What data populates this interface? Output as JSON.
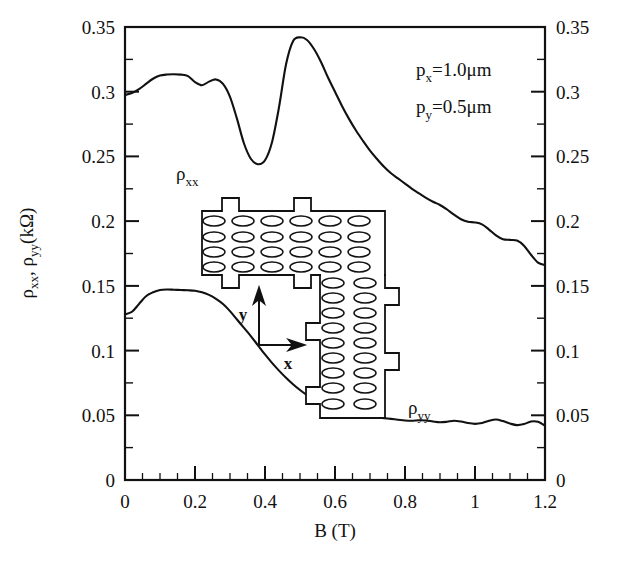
{
  "figure": {
    "background": "#ffffff",
    "ink_color": "#111111"
  },
  "chart_data": {
    "type": "line",
    "title": "",
    "xlabel": "B (T)",
    "ylabel": "ρxx, ρyy(kΩ)",
    "ylabel_parts": {
      "rho1": "ρ",
      "sub1": "xx",
      "comma": ", ",
      "rho2": "ρ",
      "sub2": "yy",
      "unit": "(kΩ)"
    },
    "xlim": [
      0,
      1.2
    ],
    "ylim": [
      0,
      0.35
    ],
    "grid": false,
    "legend_position": "inline-labels",
    "x_major_ticks": [
      0,
      0.2,
      0.4,
      0.6,
      0.8,
      1,
      1.2
    ],
    "x_major_tick_labels": [
      "0",
      "0.2",
      "0.4",
      "0.6",
      "0.8",
      "1",
      "1.2"
    ],
    "x_minor_tick_step": 0.05,
    "y_major_ticks": [
      0,
      0.05,
      0.1,
      0.15,
      0.2,
      0.25,
      0.3,
      0.35
    ],
    "y_major_tick_labels": [
      "0",
      "0.05",
      "0.1",
      "0.15",
      "0.2",
      "0.25",
      "0.3",
      "0.35"
    ],
    "left_axis_labels": [
      "0.35",
      "0.3",
      "0.25",
      "0.2",
      "0.15",
      "0.1",
      "0.05",
      "0"
    ],
    "right_axis_labels": [
      "0.35",
      "0.3",
      "0.25",
      "0.2",
      "0.15",
      "0.1",
      "0.05",
      "0"
    ],
    "series": [
      {
        "name": "ρxx",
        "label": "ρ",
        "label_sub": "xx",
        "color": "#111111",
        "x": [
          0.0,
          0.02,
          0.04,
          0.06,
          0.08,
          0.1,
          0.12,
          0.14,
          0.16,
          0.18,
          0.2,
          0.22,
          0.24,
          0.26,
          0.28,
          0.3,
          0.32,
          0.34,
          0.36,
          0.38,
          0.4,
          0.42,
          0.44,
          0.46,
          0.48,
          0.5,
          0.52,
          0.54,
          0.56,
          0.58,
          0.6,
          0.62,
          0.64,
          0.66,
          0.68,
          0.7,
          0.72,
          0.74,
          0.76,
          0.78,
          0.8,
          0.82,
          0.84,
          0.86,
          0.88,
          0.9,
          0.92,
          0.94,
          0.96,
          0.98,
          1.0,
          1.02,
          1.04,
          1.06,
          1.08,
          1.1,
          1.12,
          1.14,
          1.16,
          1.18,
          1.2
        ],
        "y": [
          0.2975,
          0.299,
          0.302,
          0.306,
          0.31,
          0.3125,
          0.3133,
          0.3135,
          0.3132,
          0.312,
          0.3075,
          0.305,
          0.3078,
          0.3095,
          0.306,
          0.296,
          0.279,
          0.26,
          0.248,
          0.244,
          0.247,
          0.261,
          0.288,
          0.321,
          0.339,
          0.342,
          0.34,
          0.333,
          0.323,
          0.311,
          0.3,
          0.289,
          0.279,
          0.27,
          0.262,
          0.2545,
          0.248,
          0.242,
          0.237,
          0.233,
          0.229,
          0.225,
          0.2215,
          0.218,
          0.215,
          0.2125,
          0.209,
          0.205,
          0.2015,
          0.1995,
          0.199,
          0.1975,
          0.1935,
          0.189,
          0.186,
          0.1855,
          0.185,
          0.181,
          0.174,
          0.168,
          0.166
        ]
      },
      {
        "name": "ρyy",
        "label": "ρ",
        "label_sub": "yy",
        "color": "#111111",
        "x": [
          0.0,
          0.02,
          0.04,
          0.06,
          0.08,
          0.1,
          0.12,
          0.14,
          0.16,
          0.18,
          0.2,
          0.22,
          0.24,
          0.26,
          0.28,
          0.3,
          0.32,
          0.34,
          0.36,
          0.38,
          0.4,
          0.42,
          0.44,
          0.46,
          0.48,
          0.5,
          0.52,
          0.54,
          0.56,
          0.58,
          0.6,
          0.62,
          0.64,
          0.66,
          0.68,
          0.7,
          0.72,
          0.74,
          0.76,
          0.78,
          0.8,
          0.82,
          0.84,
          0.86,
          0.88,
          0.9,
          0.92,
          0.94,
          0.96,
          0.98,
          1.0,
          1.02,
          1.04,
          1.06,
          1.08,
          1.1,
          1.12,
          1.14,
          1.16,
          1.18,
          1.2
        ],
        "y": [
          0.128,
          0.13,
          0.136,
          0.142,
          0.145,
          0.1468,
          0.1472,
          0.147,
          0.1468,
          0.1466,
          0.1462,
          0.145,
          0.143,
          0.14,
          0.136,
          0.1305,
          0.124,
          0.1175,
          0.111,
          0.104,
          0.097,
          0.0905,
          0.0845,
          0.079,
          0.074,
          0.0695,
          0.0655,
          0.062,
          0.059,
          0.0565,
          0.0545,
          0.0528,
          0.0515,
          0.0505,
          0.0497,
          0.049,
          0.0484,
          0.0478,
          0.0472,
          0.0466,
          0.046,
          0.0458,
          0.0462,
          0.046,
          0.0452,
          0.0446,
          0.045,
          0.0458,
          0.0452,
          0.044,
          0.0434,
          0.044,
          0.0458,
          0.0468,
          0.0455,
          0.0436,
          0.0424,
          0.0432,
          0.0452,
          0.045,
          0.042
        ]
      }
    ],
    "annotations": [
      {
        "name": "px",
        "symbol": "p",
        "subscript": "x",
        "text": "=1.0μm",
        "full": "p_x=1.0μm"
      },
      {
        "name": "py",
        "symbol": "p",
        "subscript": "y",
        "text": "=0.5μm",
        "full": "p_y=0.5μm"
      }
    ]
  },
  "inset": {
    "name": "antidot-lattice-device-diagram",
    "description": "L-shaped Hall bar with elliptical antidot array",
    "axis_x_letter": "x",
    "axis_y_letter": "y",
    "horizontal_bar_ellipse_rows": 4,
    "horizontal_bar_ellipse_cols": 6,
    "vertical_bar_ellipse_rows": 9,
    "vertical_bar_ellipse_cols": 2
  }
}
